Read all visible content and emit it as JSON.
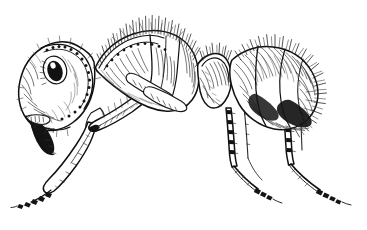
{
  "figure": {
    "title": "Ant, lateral view",
    "subject": "ant",
    "view": "lateral (side) profile, facing left",
    "medium": "pen-and-ink stipple and hatch scientific illustration",
    "style": "black line art on white background",
    "caption": "",
    "background_color": "#ffffff",
    "ink_color": "#111111",
    "canvas": {
      "width": 367,
      "height": 230
    }
  },
  "anatomy": {
    "parts": [
      {
        "name": "head",
        "label": "Head",
        "position": "left",
        "notes": "rounded capsule with stippled shading and sculptured carinae"
      },
      {
        "name": "compound-eye",
        "label": "Compound eye",
        "position": "upper-left of head",
        "notes": "dark oval with white specular highlight"
      },
      {
        "name": "mandible",
        "label": "Mandible",
        "position": "lower-left of head",
        "notes": "solid black curved hook projecting downward-left"
      },
      {
        "name": "antennal-scape",
        "label": "Antennal scape",
        "position": "below head, angled down-left",
        "notes": "long clavate segment with fine erect hairs"
      },
      {
        "name": "pronotum",
        "label": "Pronotum",
        "position": "upper mesosoma, left",
        "notes": "domed, crowned with long erect setae"
      },
      {
        "name": "mesonotum",
        "label": "Mesonotum",
        "position": "mid mesosoma",
        "notes": "hatched panel"
      },
      {
        "name": "propodeum",
        "label": "Propodeum",
        "position": "rear mesosoma",
        "notes": "sloped, bristled with setae"
      },
      {
        "name": "petiole",
        "label": "Petiole node",
        "position": "waist between mesosoma and gaster",
        "notes": "narrow node, heavily hatched"
      },
      {
        "name": "gaster",
        "label": "Gaster",
        "position": "right",
        "notes": "large ovoid, dense dark hatching with radiating hairs at apex"
      },
      {
        "name": "foreleg",
        "label": "Foreleg",
        "position": "left, descending to lower-left",
        "notes": "coxa, femur, tibia and beaded tarsus"
      },
      {
        "name": "midleg",
        "label": "Mid leg",
        "position": "center, descending",
        "notes": "spinose tibia, segmented tarsus"
      },
      {
        "name": "hindleg",
        "label": "Hind leg",
        "position": "right, descending",
        "notes": "longest leg, spinose tibia, segmented tarsus"
      }
    ]
  },
  "labels": {
    "annotations": [],
    "scale_bar": null
  }
}
